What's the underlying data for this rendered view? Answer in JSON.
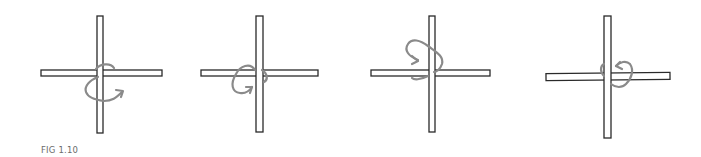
{
  "figure": {
    "caption": "FIG 1.10",
    "colors": {
      "stick_outline": "#2a2a2a",
      "stick_fill": "#ffffff",
      "arrow": "#8a8a8a",
      "caption": "#6b6b6b"
    },
    "panels": [
      {
        "id": "step-1",
        "vertical": {
          "x": 97,
          "y": 16,
          "w": 6,
          "h": 117
        },
        "horizontal": {
          "x": 41,
          "y": 70,
          "w": 121,
          "h": 6,
          "rotate": 0
        },
        "lash_path": "M96 69 C100 64 110 62 114 68 M98 77 C90 80 84 86 86 92 C88 98 96 100 104 101 C112 101 116 98 122 92",
        "arrow_head": "M116 90 L123 91 L121 97"
      },
      {
        "id": "step-2",
        "vertical": {
          "x": 256,
          "y": 16,
          "w": 7,
          "h": 116
        },
        "horizontal": {
          "x": 201,
          "y": 70,
          "w": 117,
          "h": 6,
          "rotate": 0
        },
        "lash_path": "M255 70 C250 62 240 66 236 74 C230 84 232 92 240 93 C246 94 250 90 252 87 M262 70 C268 74 268 80 264 82",
        "arrow_head": "M246 87 L252 87 L250 93"
      },
      {
        "id": "step-3",
        "vertical": {
          "x": 429,
          "y": 16,
          "w": 6,
          "h": 116
        },
        "horizontal": {
          "x": 371,
          "y": 70,
          "w": 119,
          "h": 6,
          "rotate": 0
        },
        "lash_path": "M418 60 C408 56 404 50 408 44 C412 38 420 40 428 46 C436 52 444 56 442 64 C440 70 436 72 434 72 M428 76 C420 80 414 80 412 78",
        "arrow_head": "M412 56 L418 61 L412 64"
      },
      {
        "id": "step-4",
        "vertical": {
          "x": 604,
          "y": 16,
          "w": 7,
          "h": 122
        },
        "horizontal": {
          "x": 546,
          "y": 73,
          "w": 124,
          "h": 7,
          "rotate": -0.6
        },
        "lash_path": "M604 76 C600 72 600 66 604 64 M611 84 C616 88 622 88 626 84 C632 78 634 70 630 64 C626 60 620 62 616 66",
        "arrow_head": "M620 62 L616 66 L622 69"
      }
    ]
  }
}
